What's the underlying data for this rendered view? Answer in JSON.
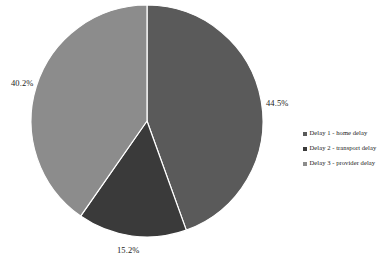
{
  "chart_data": {
    "type": "pie",
    "title": "",
    "subtitle": "",
    "xlabel": "",
    "ylabel": "",
    "grid": false,
    "legend_position": "right",
    "start_angle_deg": 0,
    "direction": "clockwise",
    "center": {
      "cx": 147,
      "cy": 121,
      "r": 116
    },
    "categories": [
      "Delay 1 - home delay",
      "Delay 2 - transport delay",
      "Delay 3 - provider delay"
    ],
    "values": [
      44.5,
      15.2,
      40.2
    ],
    "data_labels": [
      "44.5%",
      "15.2%",
      "40.2%"
    ],
    "colors": [
      "#5a5a5a",
      "#3a3a3a",
      "#8c8c8c"
    ],
    "slices": [
      {
        "name": "Delay 1 - home delay",
        "value": 44.5,
        "label": "44.5%",
        "color": "#5a5a5a",
        "start_deg": 0,
        "end_deg": 160.2
      },
      {
        "name": "Delay 2 - transport delay",
        "value": 15.2,
        "label": "15.2%",
        "color": "#3a3a3a",
        "start_deg": 160.2,
        "end_deg": 214.92
      },
      {
        "name": "Delay 3 - provider delay",
        "value": 40.2,
        "label": "40.2%",
        "color": "#8c8c8c",
        "start_deg": 214.92,
        "end_deg": 360
      }
    ]
  },
  "labels": {
    "left": "40.2%",
    "right": "44.5%",
    "bottom": "15.2%"
  },
  "legend": {
    "items": [
      {
        "label": "Delay 1 - home delay",
        "color": "#5a5a5a"
      },
      {
        "label": "Delay 2 - transport delay",
        "color": "#3a3a3a"
      },
      {
        "label": "Delay 3 - provider delay",
        "color": "#8c8c8c"
      }
    ]
  },
  "style": {
    "background": "#ffffff",
    "slice_border": "#ffffff",
    "text_color": "#1a1a1a"
  }
}
